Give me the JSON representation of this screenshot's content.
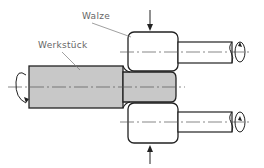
{
  "diagram": {
    "type": "technical-drawing",
    "labels": {
      "roller": "Walze",
      "workpiece": "Werkstück"
    },
    "colors": {
      "workpiece_fill": "#c8c8c8",
      "outline": "#222222",
      "centerline": "#555555",
      "leader": "#777777",
      "background": "#ffffff"
    }
  }
}
